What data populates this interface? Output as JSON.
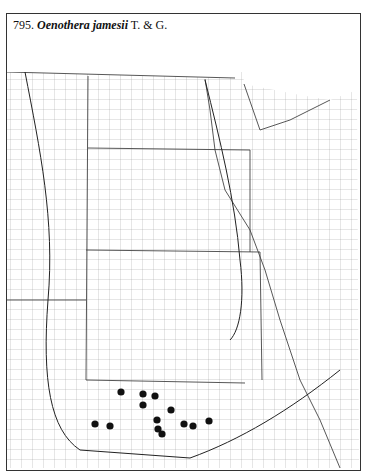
{
  "map": {
    "number": "795.",
    "species": "Oenothera jamesii",
    "authority": "T. & G.",
    "colors": {
      "line": "#333333",
      "county": "#8a8a8a",
      "dot": "#111111"
    },
    "records": [
      {
        "x": 121,
        "y": 392
      },
      {
        "x": 143,
        "y": 394
      },
      {
        "x": 155,
        "y": 396
      },
      {
        "x": 143,
        "y": 405
      },
      {
        "x": 171,
        "y": 410
      },
      {
        "x": 157,
        "y": 420
      },
      {
        "x": 209,
        "y": 421
      },
      {
        "x": 95,
        "y": 424
      },
      {
        "x": 110,
        "y": 426
      },
      {
        "x": 184,
        "y": 424
      },
      {
        "x": 193,
        "y": 426
      },
      {
        "x": 158,
        "y": 429
      },
      {
        "x": 162,
        "y": 434
      }
    ]
  }
}
